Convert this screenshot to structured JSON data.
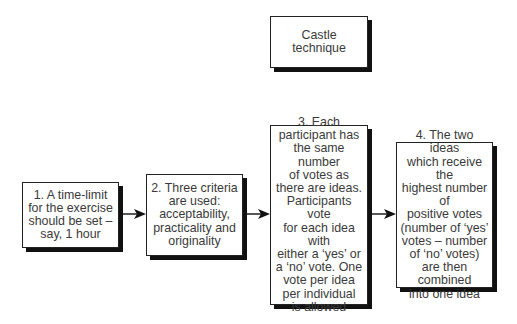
{
  "title": "Castle technique",
  "steps": [
    {
      "label": "1. A time-limit\nfor the exercise\nshould be set –\nsay, 1 hour"
    },
    {
      "label": "2. Three criteria\nare used:\nacceptability,\npracticality and\noriginality"
    },
    {
      "label": "3. Each\nparticipant has\nthe same number\nof votes as\nthere are ideas.\nParticipants vote\nfor each idea with\neither a ‘yes’ or\na ‘no’ vote. One\nvote per idea\nper individual\nis allowed"
    },
    {
      "label": "4. The two ideas\nwhich receive the\nhighest number of\npositive votes\n(number of ‘yes’\nvotes – number\nof ‘no’ votes)\nare then\ncombined\ninto one idea"
    }
  ],
  "colors": {
    "box_border": "#222222",
    "shadow": "#111111",
    "text": "#3a3a3a",
    "arrow": "#111111"
  }
}
